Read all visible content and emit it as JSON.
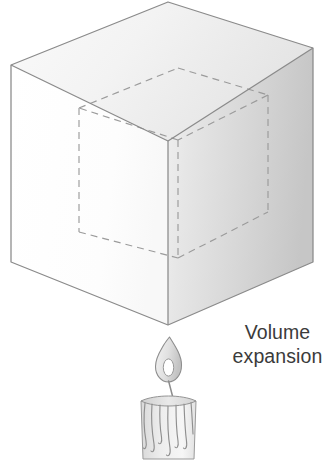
{
  "figure": {
    "caption": {
      "line1": "Volume",
      "line2": "expansion"
    },
    "caption_color": "#3b3b3b",
    "background_color": "#ffffff"
  },
  "cube": {
    "name": "expanded-cube",
    "projection": "axonometric",
    "outline_color": "#8a8a8a",
    "vertices": {
      "top_apex": [
        168,
        2
      ],
      "left": [
        11,
        65
      ],
      "right": [
        313,
        48
      ],
      "center": [
        168,
        141
      ],
      "bottom_left": [
        11,
        262
      ],
      "bottom_center": [
        168,
        325
      ],
      "bottom_right": [
        313,
        262
      ]
    },
    "faces": [
      {
        "name": "top-face",
        "fill_from": "#f6f6f6",
        "fill_to": "#e7e7e7"
      },
      {
        "name": "left-face",
        "fill_from": "#ffffff",
        "fill_to": "#fbfbfb"
      },
      {
        "name": "right-face",
        "fill_from": "#eeeeee",
        "fill_to": "#c9c9c9"
      }
    ]
  },
  "inner_cube": {
    "name": "original-volume-outline",
    "style": "dashed",
    "stroke_color": "#9a9a9a",
    "dash_pattern": "7 5",
    "description": "Dashed smaller cube showing the original volume before expansion"
  },
  "candle": {
    "name": "candle",
    "body_color_from": "#dcdcdc",
    "body_color_to": "#f4f4f4",
    "outline_color": "#8d8d8d",
    "flame": {
      "name": "candle-flame",
      "outer_fill_from": "#f2f2f2",
      "outer_fill_to": "#c8c8c8",
      "inner_fill": "#ffffff",
      "outline_color": "#8d8d8d"
    },
    "wick": {
      "name": "candle-wick",
      "color": "#8d8d8d"
    },
    "drips_count": 7
  }
}
